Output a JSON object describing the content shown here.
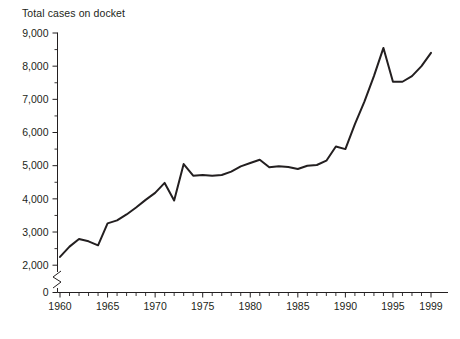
{
  "chart_data": {
    "type": "line",
    "title": "Total cases on docket",
    "xlabel": "",
    "ylabel": "",
    "xlim": [
      1960,
      1999
    ],
    "ylim": [
      0,
      9000
    ],
    "y_axis_break": true,
    "y_break_between": [
      0,
      2000
    ],
    "grid": false,
    "legend": null,
    "y_tick_labels": [
      "9,000",
      "8,000",
      "7,000",
      "6,000",
      "5,000",
      "4,000",
      "3,000",
      "2,000",
      "0"
    ],
    "y_tick_values": [
      9000,
      8000,
      7000,
      6000,
      5000,
      4000,
      3000,
      2000,
      0
    ],
    "y_minor_tick_interval": 500,
    "x_tick_labels": [
      "1960",
      "1965",
      "1970",
      "1975",
      "1980",
      "1985",
      "1990",
      "1995",
      "1999"
    ],
    "x_tick_values": [
      1960,
      1965,
      1970,
      1975,
      1980,
      1985,
      1990,
      1995,
      1999
    ],
    "x_minor_tick_interval": 1,
    "line_color": "#231f20",
    "x": [
      1960,
      1961,
      1962,
      1963,
      1964,
      1965,
      1966,
      1967,
      1968,
      1969,
      1970,
      1971,
      1972,
      1973,
      1974,
      1975,
      1976,
      1977,
      1978,
      1979,
      1980,
      1981,
      1982,
      1983,
      1984,
      1985,
      1986,
      1987,
      1988,
      1989,
      1990,
      1991,
      1992,
      1993,
      1994,
      1995,
      1996,
      1997,
      1998,
      1999
    ],
    "values": [
      2250,
      2560,
      2790,
      2720,
      2600,
      3260,
      3350,
      3530,
      3740,
      3970,
      4180,
      4480,
      3950,
      5050,
      4700,
      4720,
      4700,
      4720,
      4820,
      4980,
      5080,
      5180,
      4950,
      4980,
      4960,
      4900,
      5000,
      5020,
      5150,
      5580,
      5500,
      6250,
      6930,
      7700,
      8550,
      7530,
      7530,
      7700,
      8000,
      8400
    ]
  }
}
